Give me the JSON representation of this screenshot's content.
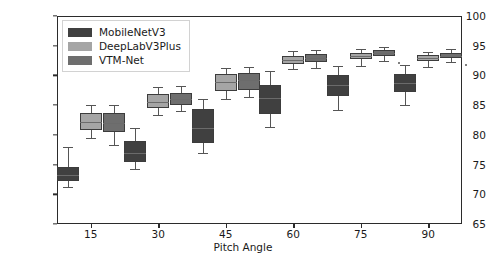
{
  "chart_data": {
    "type": "box",
    "title": "",
    "xlabel": "Pitch Angle",
    "ylabel": "mIoU(%)",
    "categories": [
      "15",
      "30",
      "45",
      "60",
      "75",
      "90"
    ],
    "ylim": [
      65,
      100
    ],
    "yticks": [
      65,
      70,
      75,
      80,
      85,
      90,
      95,
      100
    ],
    "grid": false,
    "legend_position": "upper left",
    "series": [
      {
        "name": "MobileNetV3",
        "color": "#404040",
        "boxes": [
          {
            "category": "15",
            "whisker_low": 71.2,
            "q1": 72.3,
            "median": 73.2,
            "q3": 74.6,
            "whisker_high": 77.9,
            "fliers": []
          },
          {
            "category": "30",
            "whisker_low": 74.2,
            "q1": 75.4,
            "median": 76.9,
            "q3": 78.9,
            "whisker_high": 81.1,
            "fliers": []
          },
          {
            "category": "45",
            "whisker_low": 76.9,
            "q1": 78.6,
            "median": 81.2,
            "q3": 84.3,
            "whisker_high": 86.0,
            "fliers": []
          },
          {
            "category": "60",
            "whisker_low": 81.3,
            "q1": 83.5,
            "median": 86.2,
            "q3": 88.4,
            "whisker_high": 90.8,
            "fliers": []
          },
          {
            "category": "75",
            "whisker_low": 84.2,
            "q1": 86.5,
            "median": 88.4,
            "q3": 90.0,
            "whisker_high": 91.6,
            "fliers": []
          },
          {
            "category": "90",
            "whisker_low": 85.1,
            "q1": 87.2,
            "median": 88.8,
            "q3": 90.3,
            "whisker_high": 91.7,
            "fliers": []
          }
        ]
      },
      {
        "name": "DeepLabV3Plus",
        "color": "#a5a5a5",
        "boxes": [
          {
            "category": "15",
            "whisker_low": 79.5,
            "q1": 80.8,
            "median": 82.1,
            "q3": 83.6,
            "whisker_high": 85.1,
            "fliers": []
          },
          {
            "category": "30",
            "whisker_low": 83.4,
            "q1": 84.6,
            "median": 85.6,
            "q3": 86.8,
            "whisker_high": 88.0,
            "fliers": []
          },
          {
            "category": "45",
            "whisker_low": 86.0,
            "q1": 87.3,
            "median": 88.9,
            "q3": 90.3,
            "whisker_high": 91.3,
            "fliers": []
          },
          {
            "category": "60",
            "whisker_low": 91.0,
            "q1": 92.0,
            "median": 92.6,
            "q3": 93.2,
            "whisker_high": 94.1,
            "fliers": []
          },
          {
            "category": "75",
            "whisker_low": 91.6,
            "q1": 92.7,
            "median": 93.2,
            "q3": 93.8,
            "whisker_high": 94.5,
            "fliers": []
          },
          {
            "category": "90",
            "whisker_low": 91.5,
            "q1": 92.4,
            "median": 92.9,
            "q3": 93.4,
            "whisker_high": 94.0,
            "fliers": []
          }
        ]
      },
      {
        "name": "VTM-Net",
        "color": "#6e6e6e",
        "boxes": [
          {
            "category": "15",
            "whisker_low": 78.3,
            "q1": 80.5,
            "median": 82.0,
            "q3": 83.7,
            "whisker_high": 85.1,
            "fliers": []
          },
          {
            "category": "30",
            "whisker_low": 84.0,
            "q1": 85.0,
            "median": 86.0,
            "q3": 87.0,
            "whisker_high": 88.2,
            "fliers": []
          },
          {
            "category": "45",
            "whisker_low": 86.3,
            "q1": 87.6,
            "median": 89.2,
            "q3": 90.4,
            "whisker_high": 91.4,
            "fliers": []
          },
          {
            "category": "60",
            "whisker_low": 91.3,
            "q1": 92.3,
            "median": 93.0,
            "q3": 93.6,
            "whisker_high": 94.3,
            "fliers": []
          },
          {
            "category": "75",
            "whisker_low": 92.5,
            "q1": 93.3,
            "median": 93.7,
            "q3": 94.2,
            "whisker_high": 94.8,
            "fliers": [
              92.2
            ]
          },
          {
            "category": "90",
            "whisker_low": 92.2,
            "q1": 92.9,
            "median": 93.3,
            "q3": 93.8,
            "whisker_high": 94.4,
            "fliers": [
              91.9
            ]
          }
        ]
      }
    ]
  }
}
